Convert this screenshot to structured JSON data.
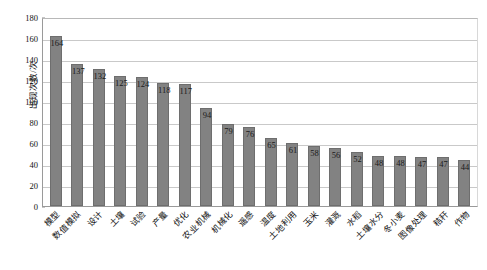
{
  "chart_data": {
    "type": "bar",
    "title": "",
    "subtitle": "",
    "xlabel": "",
    "ylabel": "出现次数/次",
    "ylim": [
      0,
      180
    ],
    "ytick_step": 20,
    "yticks": [
      "0",
      "20",
      "40",
      "60",
      "80",
      "100",
      "120",
      "140",
      "160",
      "180"
    ],
    "grid": true,
    "legend": false,
    "legend_position": "none",
    "bar_color": "#828282",
    "bar_border_color": "#6e6e6e",
    "gridline_color": "#c9c9c9",
    "axis_color": "#8d8d8d",
    "label_color": "#111111",
    "categories": [
      "模型",
      "数值模拟",
      "设计",
      "土壤",
      "试验",
      "产量",
      "优化",
      "农业机械",
      "机械化",
      "遥感",
      "温度",
      "土地利用",
      "玉米",
      "灌溉",
      "水稻",
      "土壤水分",
      "冬小麦",
      "图像处理",
      "秸秆",
      "作物"
    ],
    "values": [
      164,
      137,
      132,
      125,
      124,
      118,
      117,
      94,
      79,
      76,
      65,
      61,
      58,
      56,
      52,
      48,
      48,
      47,
      47,
      44
    ],
    "data_labels": [
      "164",
      "137",
      "132",
      "125",
      "124",
      "118",
      "117",
      "94",
      "79",
      "76",
      "65",
      "61",
      "58",
      "56",
      "52",
      "48",
      "48",
      "47",
      "47",
      "44"
    ]
  }
}
